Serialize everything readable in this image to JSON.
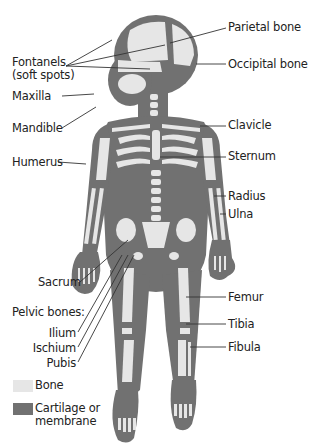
{
  "colors": {
    "bone": "#e6e6e6",
    "cartilage": "#717171",
    "leader": "#333333",
    "text": "#222222"
  },
  "labels_left": {
    "fontanels_line1": "Fontanels",
    "fontanels_line2": "(soft spots)",
    "maxilla": "Maxilla",
    "mandible": "Mandible",
    "humerus": "Humerus",
    "sacrum": "Sacrum",
    "pelvic_heading": "Pelvic bones:",
    "ilium": "Ilium",
    "ischium": "Ischium",
    "pubis": "Pubis"
  },
  "labels_right": {
    "parietal": "Parietal bone",
    "occipital": "Occipital bone",
    "clavicle": "Clavicle",
    "sternum": "Sternum",
    "radius": "Radius",
    "ulna": "Ulna",
    "femur": "Femur",
    "tibia": "Tibia",
    "fibula": "Fibula"
  },
  "legend": {
    "bone": "Bone",
    "cartilage_line1": "Cartilage or",
    "cartilage_line2": "membrane"
  }
}
